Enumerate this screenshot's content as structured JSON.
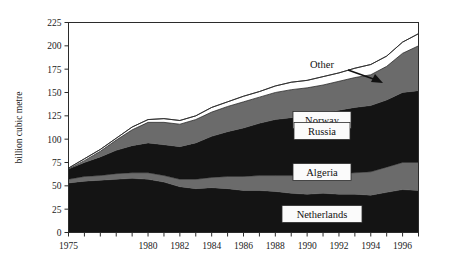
{
  "chart_data": {
    "type": "area",
    "title": "",
    "xlabel": "",
    "ylabel": "billion cubic metre",
    "stacked": true,
    "grid": false,
    "legend_position": "inline-labels",
    "xlim": [
      1975,
      1997
    ],
    "ylim": [
      0,
      225
    ],
    "ytick_labels": [
      "0",
      "25",
      "50",
      "75",
      "100",
      "125",
      "150",
      "175",
      "200",
      "225"
    ],
    "ytick_values": [
      0,
      25,
      50,
      75,
      100,
      125,
      150,
      175,
      200,
      225
    ],
    "xtick_labels": [
      "1975",
      "1980",
      "1982",
      "1984",
      "1986",
      "1988",
      "1990",
      "1992",
      "1994",
      "1996"
    ],
    "xtick_values": [
      1975,
      1980,
      1982,
      1984,
      1986,
      1988,
      1990,
      1992,
      1994,
      1996
    ],
    "x": [
      1975,
      1976,
      1977,
      1978,
      1979,
      1980,
      1981,
      1982,
      1983,
      1984,
      1985,
      1986,
      1987,
      1988,
      1989,
      1990,
      1991,
      1992,
      1993,
      1994,
      1995,
      1996,
      1997
    ],
    "series": [
      {
        "name": "Netherlands",
        "color": "#141414",
        "values": [
          53,
          55,
          56,
          57,
          58,
          57,
          54,
          49,
          47,
          48,
          47,
          45,
          45,
          44,
          42,
          41,
          42,
          41,
          41,
          40,
          43,
          46,
          45
        ]
      },
      {
        "name": "Algeria",
        "color": "#6b6b6b",
        "values": [
          4,
          5,
          5,
          6,
          6,
          7,
          7,
          8,
          10,
          11,
          13,
          15,
          16,
          17,
          19,
          19,
          20,
          22,
          23,
          25,
          27,
          29,
          30
        ]
      },
      {
        "name": "Russia",
        "color": "#141414",
        "values": [
          11,
          15,
          20,
          25,
          29,
          32,
          33,
          35,
          39,
          44,
          48,
          52,
          56,
          60,
          62,
          65,
          66,
          68,
          70,
          71,
          72,
          75,
          77
        ]
      },
      {
        "name": "Norway",
        "color": "#6b6b6b",
        "values": [
          0,
          2,
          6,
          11,
          17,
          22,
          24,
          24,
          25,
          26,
          27,
          28,
          28,
          29,
          30,
          30,
          30,
          31,
          32,
          33,
          36,
          42,
          48
        ]
      },
      {
        "name": "Other",
        "color": "#ffffff",
        "values": [
          1,
          2,
          2,
          2,
          3,
          3,
          4,
          4,
          4,
          5,
          5,
          6,
          6,
          7,
          8,
          8,
          9,
          9,
          10,
          11,
          11,
          12,
          13
        ]
      }
    ],
    "annotations": [
      {
        "text": "Other",
        "kind": "callout-with-arrow",
        "points_to_series": "Other"
      },
      {
        "text": "Norway",
        "kind": "inline-box",
        "series": "Norway"
      },
      {
        "text": "Russia",
        "kind": "inline-box",
        "series": "Russia"
      },
      {
        "text": "Algeria",
        "kind": "inline-box",
        "series": "Algeria"
      },
      {
        "text": "Netherlands",
        "kind": "inline-box",
        "series": "Netherlands"
      }
    ]
  }
}
